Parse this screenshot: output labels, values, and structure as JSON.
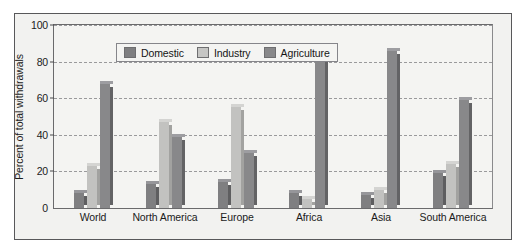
{
  "chart_data": {
    "type": "bar",
    "title": "",
    "xlabel": "",
    "ylabel": "Percent of total withdrawals",
    "ylim": [
      0,
      100
    ],
    "yticks": [
      0,
      20,
      40,
      60,
      80,
      100
    ],
    "ytick_labels": [
      "0",
      "20",
      "40",
      "60",
      "80",
      "100"
    ],
    "grid": true,
    "legend_position": "top-left inside plot",
    "categories": [
      "World",
      "North America",
      "Europe",
      "Africa",
      "Asia",
      "South America"
    ],
    "series": [
      {
        "name": "Domestic",
        "color": "#7f7f81",
        "values": [
          8,
          13,
          14,
          8,
          7,
          19
        ]
      },
      {
        "name": "Industry",
        "color": "#c2c2c0",
        "values": [
          23,
          47,
          55,
          5,
          10,
          24
        ]
      },
      {
        "name": "Agriculture",
        "color": "#88888a",
        "values": [
          68,
          39,
          30,
          88,
          86,
          59
        ]
      }
    ]
  },
  "legend": {
    "items": [
      {
        "label": "Domestic"
      },
      {
        "label": "Industry"
      },
      {
        "label": "Agriculture"
      }
    ]
  },
  "axes": {
    "y_title": "Percent of total withdrawals"
  }
}
